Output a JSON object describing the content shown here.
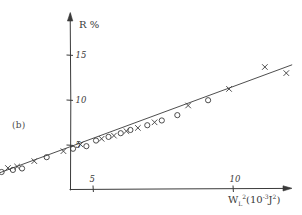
{
  "figure": {
    "panel_label": "(b)",
    "background_color": "#ffffff",
    "ink_color": "#3a3a3a"
  },
  "chart_data": {
    "type": "scatter",
    "title": "",
    "subtitle": "",
    "xlabel": "W²ₗ (10⁻³ J²)",
    "xlabel_parts": {
      "symbol": "W",
      "subscript": "L",
      "superscript": "2",
      "units_open": "(10",
      "units_exp": "-3",
      "units_body": "J",
      "units_exp2": "2",
      "units_close": ")"
    },
    "ylabel": "R %",
    "xlim": [
      0,
      12.8
    ],
    "ylim": [
      0,
      16.8
    ],
    "xticks": [
      5,
      10
    ],
    "yticks": [
      5,
      10,
      15
    ],
    "xtick_labels": [
      "5",
      "10"
    ],
    "ytick_labels": [
      "5",
      "10",
      "15"
    ],
    "grid": false,
    "legend": false,
    "axis_style": "hand-drawn-arrows",
    "series": [
      {
        "name": "circles",
        "marker": "o",
        "x": [
          0.15,
          0.55,
          0.95,
          1.3,
          1.75,
          2.15,
          2.45,
          3.35,
          4.3,
          4.75,
          5.1,
          5.55,
          6.0,
          6.35,
          6.95,
          7.45,
          8.0,
          9.1
        ],
        "y": [
          0.35,
          0.85,
          1.25,
          1.7,
          2.05,
          2.2,
          2.35,
          3.6,
          4.6,
          4.9,
          5.45,
          5.9,
          6.35,
          6.7,
          7.15,
          7.75,
          8.35,
          10.0
        ]
      },
      {
        "name": "crosses",
        "marker": "x",
        "x": [
          0.35,
          0.75,
          1.15,
          1.55,
          1.95,
          2.3,
          2.9,
          3.95,
          4.55,
          5.3,
          5.75,
          6.2,
          6.6,
          7.2,
          8.4,
          9.85,
          11.15,
          11.9
        ],
        "y": [
          0.6,
          1.05,
          1.5,
          1.9,
          2.45,
          2.6,
          3.2,
          4.35,
          5.05,
          5.7,
          6.05,
          6.5,
          6.9,
          7.5,
          9.35,
          11.2,
          13.7,
          13.0
        ]
      }
    ],
    "fit_line": {
      "name": "linear-fit",
      "x_start": 0.0,
      "y_start": 0.0,
      "x_end": 12.1,
      "y_end": 13.9
    }
  }
}
